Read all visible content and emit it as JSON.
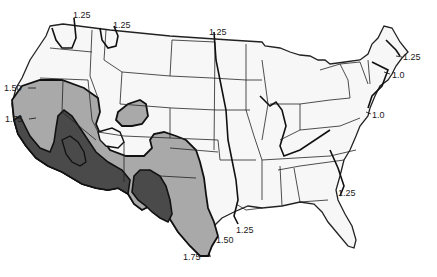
{
  "map": {
    "region": "Contiguous United States",
    "colors": {
      "background": "#ffffff",
      "land": "#f7f7f7",
      "state_border": "#222222",
      "zone_150": "#a9a9a9",
      "zone_175": "#4a4a4a",
      "contour_line": "#111111"
    },
    "legend_zones": [
      {
        "name": "zone-1.50",
        "label": "1.50",
        "fill": "#a9a9a9"
      },
      {
        "name": "zone-1.75",
        "label": "1.75",
        "fill": "#4a4a4a"
      }
    ],
    "contour_labels": [
      {
        "id": "wa-125",
        "text": "1.25",
        "x": 73,
        "y": 14
      },
      {
        "id": "mt-125",
        "text": "1.25",
        "x": 113,
        "y": 24
      },
      {
        "id": "nd-125",
        "text": "1.25",
        "x": 209,
        "y": 31
      },
      {
        "id": "me-125",
        "text": "1.25",
        "x": 403,
        "y": 53
      },
      {
        "id": "ma-10",
        "text": "1.0",
        "x": 392,
        "y": 71
      },
      {
        "id": "nj-10",
        "text": "1.0",
        "x": 372,
        "y": 110
      },
      {
        "id": "or-150",
        "text": "1.50",
        "x": 16,
        "y": 84
      },
      {
        "id": "ca-175",
        "text": "1.75",
        "x": 17,
        "y": 115
      },
      {
        "id": "ga-125",
        "text": "1.25",
        "x": 338,
        "y": 188
      },
      {
        "id": "la-125",
        "text": "1.25",
        "x": 236,
        "y": 226
      },
      {
        "id": "tx-150",
        "text": "1.50",
        "x": 216,
        "y": 236
      },
      {
        "id": "tx-175",
        "text": "1.75",
        "x": 183,
        "y": 252
      }
    ]
  }
}
